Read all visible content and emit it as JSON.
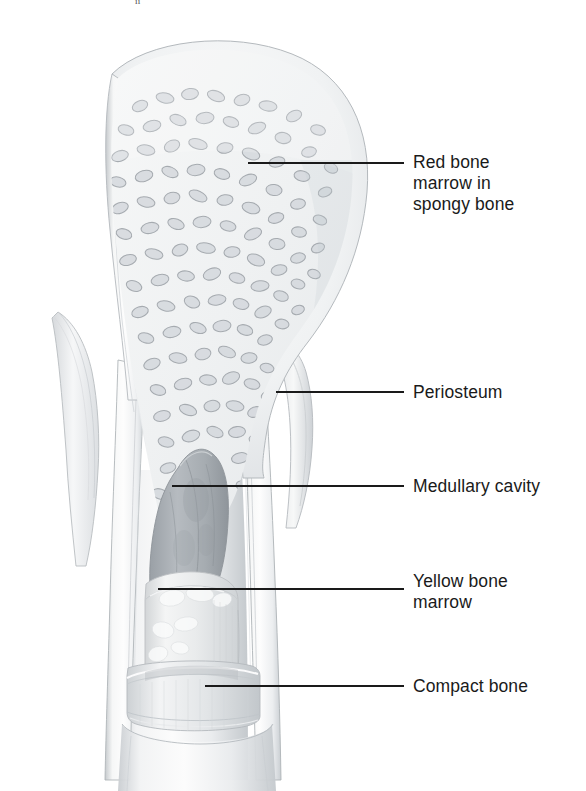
{
  "figure": {
    "domain": "anatomical-illustration",
    "background_color": "#ffffff",
    "width": 586,
    "height": 791,
    "top_partial_text": "ii"
  },
  "labels": [
    {
      "id": "red-bone-marrow",
      "text": "Red bone\nmarrow in\nspongy bone",
      "lines": [
        "Red bone",
        "marrow in",
        "spongy bone"
      ],
      "text_x": 413,
      "text_y": 152,
      "leader": {
        "x1": 248,
        "y1": 163,
        "x2": 404,
        "y2": 163
      }
    },
    {
      "id": "periosteum",
      "text": "Periosteum",
      "lines": [
        "Periosteum"
      ],
      "text_x": 413,
      "text_y": 382,
      "leader": {
        "x1": 276,
        "y1": 392,
        "x2": 404,
        "y2": 392
      }
    },
    {
      "id": "medullary-cavity",
      "text": "Medullary cavity",
      "lines": [
        "Medullary cavity"
      ],
      "text_x": 413,
      "text_y": 476,
      "leader": {
        "x1": 172,
        "y1": 486,
        "x2": 404,
        "y2": 486
      }
    },
    {
      "id": "yellow-bone-marrow",
      "text": "Yellow bone\nmarrow",
      "lines": [
        "Yellow bone",
        "marrow"
      ],
      "text_x": 413,
      "text_y": 571,
      "leader": {
        "x1": 158,
        "y1": 589,
        "x2": 404,
        "y2": 589
      }
    },
    {
      "id": "compact-bone",
      "text": "Compact bone",
      "lines": [
        "Compact bone"
      ],
      "text_x": 413,
      "text_y": 676,
      "leader": {
        "x1": 205,
        "y1": 686,
        "x2": 404,
        "y2": 686
      }
    }
  ],
  "palette": {
    "leader_line": "#1a1a1a",
    "label_text": "#1a1a1a",
    "bone_outline": "#b8bcc0",
    "compact_bone_light": "#f4f5f6",
    "compact_bone_mid": "#dfe2e4",
    "compact_bone_shadow": "#c3c8cc",
    "spongy_background": "#f2f3f4",
    "trabecula_stroke": "#a9aeb3",
    "trabecula_fill": "#c9ced3",
    "medullary_cavity": "#b9bec3",
    "medullary_cavity_dark": "#9ba0a6",
    "yellow_marrow": "#e3e5e6",
    "yellow_marrow_highlight": "#f7f8f8",
    "periosteum_flap": "#eceef0",
    "shaft_fill": "#eef0f1"
  },
  "structures": [
    {
      "name": "epiphysis-head",
      "description": "Rounded proximal head filled with spongy (cancellous) bone"
    },
    {
      "name": "spongy-bone-trabeculae",
      "description": "Lattice of trabeculae housing red bone marrow"
    },
    {
      "name": "periosteum-flap",
      "description": "Peeled-back fibrous membrane on both sides of the shaft"
    },
    {
      "name": "medullary-cavity",
      "description": "Central hollow canal within the diaphysis"
    },
    {
      "name": "yellow-bone-marrow-plug",
      "description": "Fatty marrow occupying the medullary cavity"
    },
    {
      "name": "compact-bone-ring",
      "description": "Dense cortical bone forming the outer wall and cut ring"
    },
    {
      "name": "diaphysis-shaft",
      "description": "Cylindrical shaft of the long bone"
    }
  ]
}
